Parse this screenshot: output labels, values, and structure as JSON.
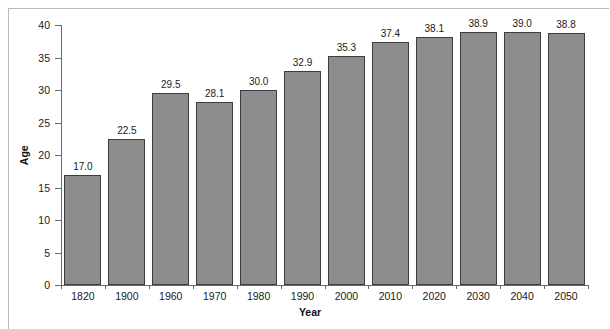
{
  "chart_data": {
    "type": "bar",
    "title": "",
    "xlabel": "Year",
    "ylabel": "Age",
    "categories": [
      "1820",
      "1900",
      "1960",
      "1970",
      "1980",
      "1990",
      "2000",
      "2010",
      "2020",
      "2030",
      "2040",
      "2050"
    ],
    "values": [
      17.0,
      22.5,
      29.5,
      28.1,
      30.0,
      32.9,
      35.3,
      37.4,
      38.1,
      38.9,
      39.0,
      38.8
    ],
    "value_labels": [
      "17.0",
      "22.5",
      "29.5",
      "28.1",
      "30.0",
      "32.9",
      "35.3",
      "37.4",
      "38.1",
      "38.9",
      "39.0",
      "38.8"
    ],
    "ylim": [
      0,
      40
    ],
    "y_ticks": [
      0,
      5,
      10,
      15,
      20,
      25,
      30,
      35,
      40
    ],
    "y_tick_labels": [
      "0",
      "5",
      "10",
      "15",
      "20",
      "25",
      "30",
      "35",
      "40"
    ],
    "grid": false,
    "legend": "none",
    "bar_color": "#8d8d8d",
    "bar_edge_color": "#3d3d3d",
    "axis_color": "#6b6b6b",
    "text_color": "#1a1a1a",
    "frame_color": "#b9b9b9",
    "background": "#ffffff"
  }
}
